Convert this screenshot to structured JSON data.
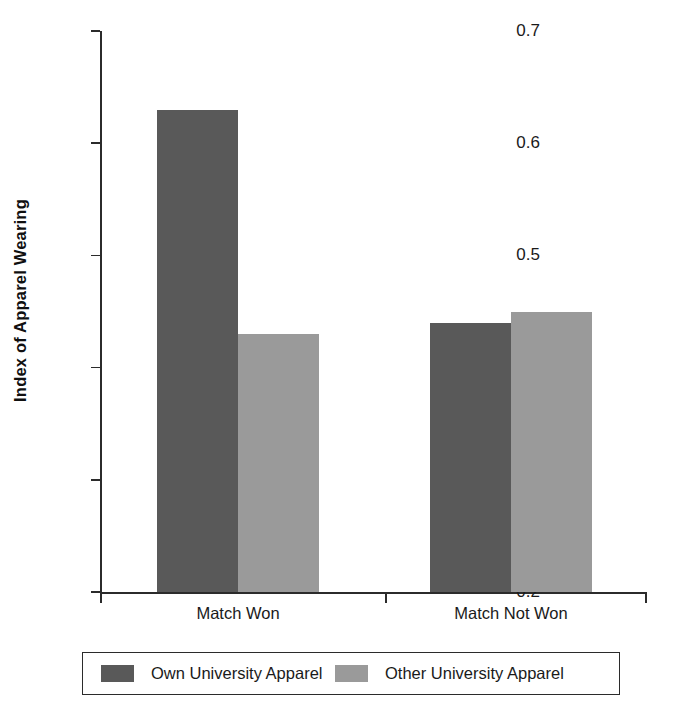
{
  "chart_data": {
    "type": "bar",
    "title": "",
    "subtitle": "",
    "xlabel": "",
    "ylabel": "Index of Apparel Wearing",
    "categories": [
      "Match Won",
      "Match Not Won"
    ],
    "series": [
      {
        "name": "Own University Apparel",
        "values": [
          0.63,
          0.44
        ],
        "color": "#595959"
      },
      {
        "name": "Other University Apparel",
        "values": [
          0.43,
          0.45
        ],
        "color": "#9a9a9a"
      }
    ],
    "ylim": [
      0.2,
      0.7
    ],
    "yticks": [
      0.2,
      0.3,
      0.4,
      0.5,
      0.6,
      0.7
    ],
    "ytick_labels": [
      "0.2",
      "0.3",
      "0.4",
      "0.5",
      "0.6",
      "0.7"
    ],
    "grid": false,
    "legend_position": "bottom"
  },
  "axis": {
    "y_title": "Index of Apparel Wearing",
    "ticks": [
      {
        "value": 0.7,
        "label": "0.7"
      },
      {
        "value": 0.6,
        "label": "0.6"
      },
      {
        "value": 0.5,
        "label": "0.5"
      },
      {
        "value": 0.4,
        "label": "0.4"
      },
      {
        "value": 0.3,
        "label": "0.3"
      },
      {
        "value": 0.2,
        "label": "0.2"
      }
    ]
  },
  "categories": [
    {
      "label": "Match Won"
    },
    {
      "label": "Match Not Won"
    }
  ],
  "legend": {
    "entries": [
      {
        "label": "Own University Apparel",
        "color": "#595959"
      },
      {
        "label": "Other University Apparel",
        "color": "#9a9a9a"
      }
    ]
  }
}
